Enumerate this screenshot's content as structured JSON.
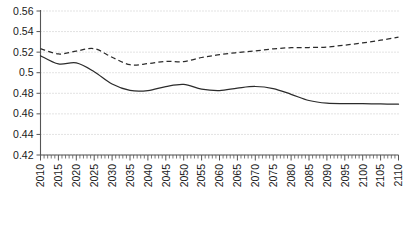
{
  "chart_data": {
    "type": "line",
    "title": "",
    "xlabel": "",
    "ylabel": "",
    "xlim": [
      2010,
      2110
    ],
    "ylim": [
      0.42,
      0.56
    ],
    "grid": true,
    "legend": "none",
    "y_ticks": [
      "0.56",
      "0.54",
      "0.52",
      "0.5",
      "0.48",
      "0.46",
      "0.44",
      "0.42"
    ],
    "y_tick_values": [
      0.56,
      0.54,
      0.52,
      0.5,
      0.48,
      0.46,
      0.44,
      0.42
    ],
    "x_ticks": [
      "2010",
      "2015",
      "2020",
      "2025",
      "2030",
      "2035",
      "2040",
      "2045",
      "2050",
      "2055",
      "2060",
      "2065",
      "2070",
      "2075",
      "2080",
      "2085",
      "2090",
      "2095",
      "2100",
      "2105",
      "2110"
    ],
    "x_tick_values": [
      2010,
      2015,
      2020,
      2025,
      2030,
      2035,
      2040,
      2045,
      2050,
      2055,
      2060,
      2065,
      2070,
      2075,
      2080,
      2085,
      2090,
      2095,
      2100,
      2105,
      2110
    ],
    "x": [
      2010,
      2015,
      2020,
      2025,
      2030,
      2035,
      2040,
      2045,
      2050,
      2055,
      2060,
      2065,
      2070,
      2075,
      2080,
      2085,
      2090,
      2095,
      2100,
      2105,
      2110
    ],
    "series": [
      {
        "name": "solid-series",
        "style": "solid",
        "color": "#2b2b2b",
        "values": [
          0.5165,
          0.5085,
          0.5095,
          0.501,
          0.489,
          0.4828,
          0.4826,
          0.4865,
          0.4886,
          0.484,
          0.4826,
          0.485,
          0.4866,
          0.4846,
          0.479,
          0.473,
          0.4704,
          0.47,
          0.4699,
          0.4696,
          0.4694
        ]
      },
      {
        "name": "dashed-series",
        "style": "dashed",
        "color": "#2b2b2b",
        "values": [
          0.5235,
          0.5182,
          0.521,
          0.5234,
          0.515,
          0.5078,
          0.5088,
          0.511,
          0.5108,
          0.5148,
          0.5175,
          0.5196,
          0.5212,
          0.5232,
          0.5243,
          0.5245,
          0.525,
          0.5268,
          0.529,
          0.5316,
          0.5345
        ]
      }
    ]
  }
}
